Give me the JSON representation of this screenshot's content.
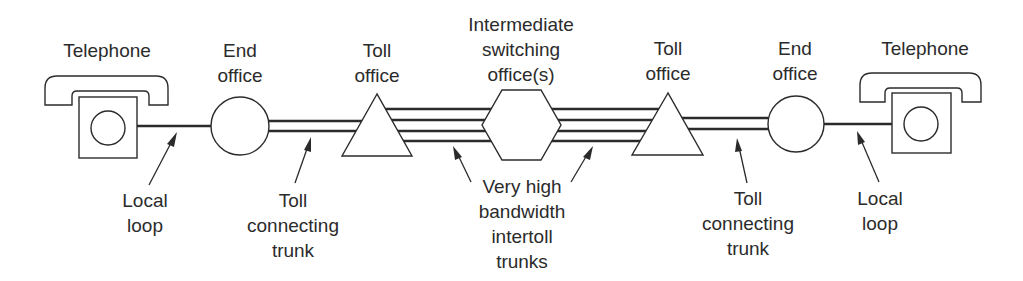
{
  "diagram": {
    "type": "telephone-network-path",
    "colors": {
      "ink": "#2b2b2b",
      "background": "#ffffff"
    },
    "nodes": [
      {
        "id": "telephone-left",
        "shape": "telephone",
        "label": [
          "Telephone"
        ]
      },
      {
        "id": "end-office-left",
        "shape": "circle",
        "label": [
          "End",
          "office"
        ]
      },
      {
        "id": "toll-office-left",
        "shape": "triangle",
        "label": [
          "Toll",
          "office"
        ]
      },
      {
        "id": "intermediate-switching",
        "shape": "hexagon",
        "label": [
          "Intermediate",
          "switching",
          "office(s)"
        ]
      },
      {
        "id": "toll-office-right",
        "shape": "triangle",
        "label": [
          "Toll",
          "office"
        ]
      },
      {
        "id": "end-office-right",
        "shape": "circle",
        "label": [
          "End",
          "office"
        ]
      },
      {
        "id": "telephone-right",
        "shape": "telephone",
        "label": [
          "Telephone"
        ]
      }
    ],
    "links": [
      {
        "from": "telephone-left",
        "to": "end-office-left",
        "lines": 1,
        "label": [
          "Local",
          "loop"
        ]
      },
      {
        "from": "end-office-left",
        "to": "toll-office-left",
        "lines": 2,
        "label": [
          "Toll",
          "connecting",
          "trunk"
        ]
      },
      {
        "from": "toll-office-left",
        "to": "intermediate-switching",
        "lines": 4
      },
      {
        "from": "intermediate-switching",
        "to": "toll-office-right",
        "lines": 4
      },
      {
        "from": "toll-office-right",
        "to": "end-office-right",
        "lines": 2,
        "label": [
          "Toll",
          "connecting",
          "trunk"
        ]
      },
      {
        "from": "end-office-right",
        "to": "telephone-right",
        "lines": 1,
        "label": [
          "Local",
          "loop"
        ]
      }
    ],
    "shared_label": {
      "applies_to": [
        "toll-office-left->intermediate-switching",
        "intermediate-switching->toll-office-right"
      ],
      "label": [
        "Very high",
        "bandwidth",
        "intertoll",
        "trunks"
      ]
    }
  }
}
